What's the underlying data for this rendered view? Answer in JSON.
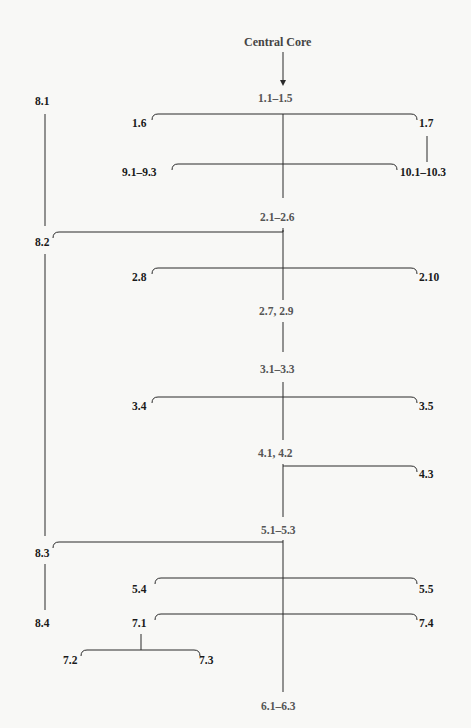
{
  "diagram": {
    "title": "Central Core",
    "colors": {
      "background": "#f8f8f6",
      "line": "#2a2a2a",
      "core_text": "#555555",
      "branch_text": "#1a1a1a"
    },
    "nodes": {
      "central_core": "Central Core",
      "n1_1_1_5": "1.1–1.5",
      "n1_6": "1.6",
      "n1_7": "1.7",
      "n9_1_9_3": "9.1–9.3",
      "n10_1_10_3": "10.1–10.3",
      "n2_1_2_6": "2.1–2.6",
      "n2_8": "2.8",
      "n2_10": "2.10",
      "n2_7_2_9": "2.7, 2.9",
      "n3_1_3_3": "3.1–3.3",
      "n3_4": "3.4",
      "n3_5": "3.5",
      "n4_1_4_2": "4.1, 4.2",
      "n4_3": "4.3",
      "n5_1_5_3": "5.1–5.3",
      "n5_4": "5.4",
      "n5_5": "5.5",
      "n7_1": "7.1",
      "n7_4": "7.4",
      "n7_2": "7.2",
      "n7_3": "7.3",
      "n6_1_6_3": "6.1–6.3",
      "n8_1": "8.1",
      "n8_2": "8.2",
      "n8_3": "8.3",
      "n8_4": "8.4"
    },
    "edges": [
      [
        "Central Core",
        "1.1–1.5"
      ],
      [
        "1.1–1.5",
        "1.6"
      ],
      [
        "1.1–1.5",
        "1.7"
      ],
      [
        "1.7",
        "10.1–10.3"
      ],
      [
        "1.1–1.5",
        "9.1–9.3"
      ],
      [
        "1.1–1.5",
        "10.1–10.3"
      ],
      [
        "1.1–1.5",
        "2.1–2.6"
      ],
      [
        "2.1–2.6",
        "8.2"
      ],
      [
        "2.1–2.6",
        "2.8"
      ],
      [
        "2.1–2.6",
        "2.10"
      ],
      [
        "2.1–2.6",
        "2.7, 2.9"
      ],
      [
        "2.7, 2.9",
        "3.1–3.3"
      ],
      [
        "3.1–3.3",
        "3.4"
      ],
      [
        "3.1–3.3",
        "3.5"
      ],
      [
        "3.1–3.3",
        "4.1, 4.2"
      ],
      [
        "4.1, 4.2",
        "4.3"
      ],
      [
        "4.1, 4.2",
        "5.1–5.3"
      ],
      [
        "5.1–5.3",
        "8.3"
      ],
      [
        "5.1–5.3",
        "5.4"
      ],
      [
        "5.1–5.3",
        "5.5"
      ],
      [
        "5.1–5.3",
        "7.1"
      ],
      [
        "5.1–5.3",
        "7.4"
      ],
      [
        "7.1",
        "7.2"
      ],
      [
        "7.1",
        "7.3"
      ],
      [
        "5.1–5.3",
        "6.1–6.3"
      ],
      [
        "8.1",
        "8.2"
      ],
      [
        "8.2",
        "8.3"
      ],
      [
        "8.3",
        "8.4"
      ]
    ]
  }
}
